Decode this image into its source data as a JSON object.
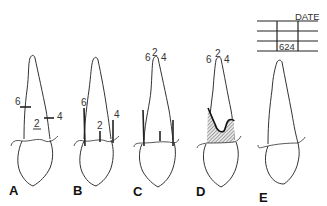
{
  "figure": {
    "panels": [
      {
        "label": "A",
        "readings": {
          "distal": "6",
          "middle": "2",
          "mesial": "4"
        }
      },
      {
        "label": "B",
        "readings": {
          "distal": "6",
          "middle": "2",
          "mesial": "4"
        }
      },
      {
        "label": "C",
        "readings": {
          "distal": "6",
          "middle": "2",
          "mesial": "4"
        }
      },
      {
        "label": "D",
        "readings": {
          "distal": "6",
          "middle": "2",
          "mesial": "4"
        }
      },
      {
        "label": "E"
      }
    ],
    "chart": {
      "header": "DATE",
      "value": "624"
    },
    "colors": {
      "line": "#333333",
      "hatch": "#999999",
      "background": "#ffffff"
    }
  }
}
